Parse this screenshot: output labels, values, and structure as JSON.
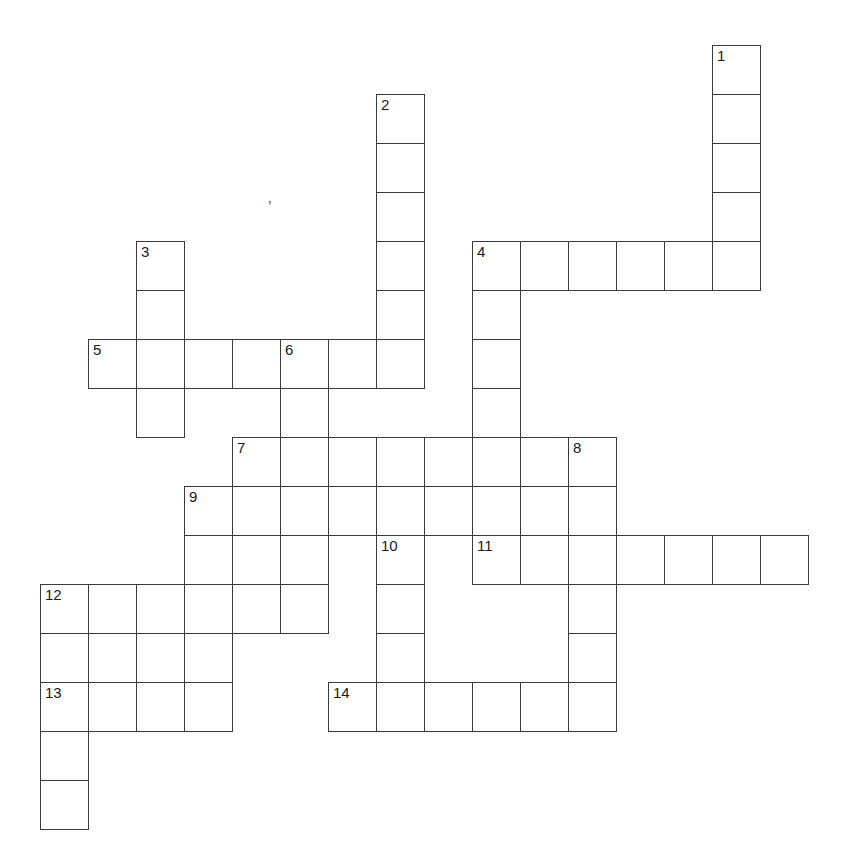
{
  "puzzle": {
    "kind": "crossword-grid",
    "title": "",
    "grid": {
      "origin_x": 40,
      "origin_y": 45,
      "cell_width": 48,
      "cell_height": 49,
      "columns": 16,
      "rows": 17,
      "line_color": "#3a3a3a",
      "cell_fill": "#ffffff",
      "number_color": "#1a1a1a"
    },
    "entries": [
      {
        "number": "1",
        "direction": "down",
        "col": 14,
        "row": 0,
        "length": 5
      },
      {
        "number": "2",
        "direction": "down",
        "col": 7,
        "row": 1,
        "length": 6
      },
      {
        "number": "3",
        "direction": "down",
        "col": 2,
        "row": 4,
        "length": 4
      },
      {
        "number": "4",
        "direction": "across",
        "col": 9,
        "row": 4,
        "length": 6
      },
      {
        "number": "4",
        "direction": "down",
        "col": 9,
        "row": 4,
        "length": 7
      },
      {
        "number": "5",
        "direction": "across",
        "col": 1,
        "row": 6,
        "length": 7
      },
      {
        "number": "6",
        "direction": "down",
        "col": 5,
        "row": 6,
        "length": 6
      },
      {
        "number": "7",
        "direction": "across",
        "col": 4,
        "row": 8,
        "length": 8
      },
      {
        "number": "7",
        "direction": "down",
        "col": 4,
        "row": 8,
        "length": 4
      },
      {
        "number": "8",
        "direction": "down",
        "col": 11,
        "row": 8,
        "length": 6
      },
      {
        "number": "9",
        "direction": "across",
        "col": 3,
        "row": 9,
        "length": 9
      },
      {
        "number": "9",
        "direction": "down",
        "col": 3,
        "row": 9,
        "length": 3
      },
      {
        "number": "10",
        "direction": "down",
        "col": 7,
        "row": 10,
        "length": 4
      },
      {
        "number": "11",
        "direction": "across",
        "col": 9,
        "row": 10,
        "length": 7
      },
      {
        "number": "12",
        "direction": "across",
        "col": 0,
        "row": 11,
        "length": 6
      },
      {
        "number": "12",
        "direction": "down",
        "col": 0,
        "row": 11,
        "length": 5
      },
      {
        "number": "13",
        "direction": "across",
        "col": 0,
        "row": 13,
        "length": 4
      },
      {
        "number": "14",
        "direction": "across",
        "col": 6,
        "row": 13,
        "length": 6
      }
    ],
    "cells": [
      {
        "col": 14,
        "row": 0,
        "number": "1"
      },
      {
        "col": 14,
        "row": 1,
        "number": ""
      },
      {
        "col": 7,
        "row": 1,
        "number": "2"
      },
      {
        "col": 7,
        "row": 2,
        "number": ""
      },
      {
        "col": 14,
        "row": 2,
        "number": ""
      },
      {
        "col": 7,
        "row": 3,
        "number": ""
      },
      {
        "col": 14,
        "row": 3,
        "number": ""
      },
      {
        "col": 2,
        "row": 4,
        "number": "3"
      },
      {
        "col": 7,
        "row": 4,
        "number": ""
      },
      {
        "col": 9,
        "row": 4,
        "number": "4"
      },
      {
        "col": 10,
        "row": 4,
        "number": ""
      },
      {
        "col": 11,
        "row": 4,
        "number": ""
      },
      {
        "col": 12,
        "row": 4,
        "number": ""
      },
      {
        "col": 13,
        "row": 4,
        "number": ""
      },
      {
        "col": 14,
        "row": 4,
        "number": ""
      },
      {
        "col": 2,
        "row": 5,
        "number": ""
      },
      {
        "col": 7,
        "row": 5,
        "number": ""
      },
      {
        "col": 9,
        "row": 5,
        "number": ""
      },
      {
        "col": 1,
        "row": 6,
        "number": "5"
      },
      {
        "col": 2,
        "row": 6,
        "number": ""
      },
      {
        "col": 3,
        "row": 6,
        "number": ""
      },
      {
        "col": 4,
        "row": 6,
        "number": ""
      },
      {
        "col": 5,
        "row": 6,
        "number": "6"
      },
      {
        "col": 6,
        "row": 6,
        "number": ""
      },
      {
        "col": 7,
        "row": 6,
        "number": ""
      },
      {
        "col": 9,
        "row": 6,
        "number": ""
      },
      {
        "col": 2,
        "row": 7,
        "number": ""
      },
      {
        "col": 5,
        "row": 7,
        "number": ""
      },
      {
        "col": 9,
        "row": 7,
        "number": ""
      },
      {
        "col": 4,
        "row": 8,
        "number": "7"
      },
      {
        "col": 5,
        "row": 8,
        "number": ""
      },
      {
        "col": 6,
        "row": 8,
        "number": ""
      },
      {
        "col": 7,
        "row": 8,
        "number": ""
      },
      {
        "col": 8,
        "row": 8,
        "number": ""
      },
      {
        "col": 9,
        "row": 8,
        "number": ""
      },
      {
        "col": 10,
        "row": 8,
        "number": ""
      },
      {
        "col": 11,
        "row": 8,
        "number": "8"
      },
      {
        "col": 3,
        "row": 9,
        "number": "9"
      },
      {
        "col": 4,
        "row": 9,
        "number": ""
      },
      {
        "col": 5,
        "row": 9,
        "number": ""
      },
      {
        "col": 6,
        "row": 9,
        "number": ""
      },
      {
        "col": 7,
        "row": 9,
        "number": ""
      },
      {
        "col": 8,
        "row": 9,
        "number": ""
      },
      {
        "col": 9,
        "row": 9,
        "number": ""
      },
      {
        "col": 10,
        "row": 9,
        "number": ""
      },
      {
        "col": 11,
        "row": 9,
        "number": ""
      },
      {
        "col": 3,
        "row": 10,
        "number": ""
      },
      {
        "col": 4,
        "row": 10,
        "number": ""
      },
      {
        "col": 5,
        "row": 10,
        "number": ""
      },
      {
        "col": 7,
        "row": 10,
        "number": "10"
      },
      {
        "col": 9,
        "row": 10,
        "number": "11"
      },
      {
        "col": 10,
        "row": 10,
        "number": ""
      },
      {
        "col": 11,
        "row": 10,
        "number": ""
      },
      {
        "col": 12,
        "row": 10,
        "number": ""
      },
      {
        "col": 13,
        "row": 10,
        "number": ""
      },
      {
        "col": 14,
        "row": 10,
        "number": ""
      },
      {
        "col": 15,
        "row": 10,
        "number": ""
      },
      {
        "col": 0,
        "row": 11,
        "number": "12"
      },
      {
        "col": 1,
        "row": 11,
        "number": ""
      },
      {
        "col": 2,
        "row": 11,
        "number": ""
      },
      {
        "col": 3,
        "row": 11,
        "number": ""
      },
      {
        "col": 4,
        "row": 11,
        "number": ""
      },
      {
        "col": 5,
        "row": 11,
        "number": ""
      },
      {
        "col": 7,
        "row": 11,
        "number": ""
      },
      {
        "col": 11,
        "row": 11,
        "number": ""
      },
      {
        "col": 0,
        "row": 12,
        "number": ""
      },
      {
        "col": 1,
        "row": 12,
        "number": ""
      },
      {
        "col": 2,
        "row": 12,
        "number": ""
      },
      {
        "col": 3,
        "row": 12,
        "number": ""
      },
      {
        "col": 7,
        "row": 12,
        "number": ""
      },
      {
        "col": 11,
        "row": 12,
        "number": ""
      },
      {
        "col": 0,
        "row": 13,
        "number": "13"
      },
      {
        "col": 1,
        "row": 13,
        "number": ""
      },
      {
        "col": 2,
        "row": 13,
        "number": ""
      },
      {
        "col": 3,
        "row": 13,
        "number": ""
      },
      {
        "col": 6,
        "row": 13,
        "number": "14"
      },
      {
        "col": 7,
        "row": 13,
        "number": ""
      },
      {
        "col": 8,
        "row": 13,
        "number": ""
      },
      {
        "col": 9,
        "row": 13,
        "number": ""
      },
      {
        "col": 10,
        "row": 13,
        "number": ""
      },
      {
        "col": 11,
        "row": 13,
        "number": ""
      },
      {
        "col": 0,
        "row": 14,
        "number": ""
      },
      {
        "col": 0,
        "row": 15,
        "number": ""
      }
    ],
    "stray_marks": [
      {
        "glyph": "’",
        "x": 268,
        "y": 200
      }
    ]
  }
}
